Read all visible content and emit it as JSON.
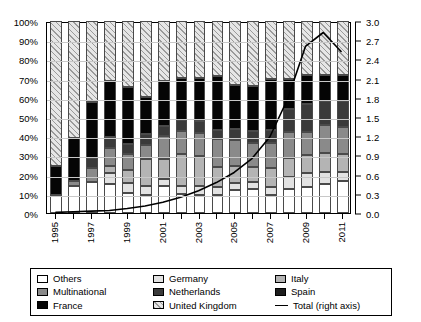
{
  "chart_data": {
    "type": "bar",
    "subtype": "stacked-100-percent-with-line-overlay",
    "title": "",
    "xlabel": "",
    "ylabel": "",
    "y2label": "",
    "grid": true,
    "legend_position": "bottom",
    "x": [
      1995,
      1996,
      1997,
      1998,
      1999,
      2000,
      2001,
      2002,
      2003,
      2004,
      2005,
      2006,
      2007,
      2008,
      2009,
      2010,
      2011
    ],
    "x_tick_labels": [
      "1995",
      "",
      "1997",
      "",
      "1999",
      "",
      "2001",
      "",
      "2003",
      "",
      "2005",
      "",
      "2007",
      "",
      "2009",
      "",
      "2011"
    ],
    "ylim": [
      0,
      100
    ],
    "y_tick_labels": [
      "0%",
      "10%",
      "20%",
      "30%",
      "40%",
      "50%",
      "60%",
      "70%",
      "80%",
      "90%",
      "100%"
    ],
    "y_ticks": [
      0,
      10,
      20,
      30,
      40,
      50,
      60,
      70,
      80,
      90,
      100
    ],
    "y2lim": [
      0,
      3.0
    ],
    "y2_tick_labels": [
      "0.0",
      "0.3",
      "0.6",
      "0.9",
      "1.2",
      "1.5",
      "1.8",
      "2.1",
      "2.4",
      "2.7",
      "3.0"
    ],
    "y2_ticks": [
      0,
      0.3,
      0.6,
      0.9,
      1.2,
      1.5,
      1.8,
      2.1,
      2.4,
      2.7,
      3.0
    ],
    "series": [
      {
        "name": "Others",
        "key": "others",
        "values": [
          9.2,
          14.2,
          16.0,
          15.0,
          10.3,
          9.2,
          14.3,
          9.8,
          9.3,
          9.2,
          12.2,
          12.4,
          9.3,
          12.6,
          13.8,
          15.1,
          16.5
        ]
      },
      {
        "name": "Germany",
        "key": "germany",
        "values": [
          0.0,
          0.0,
          0.0,
          6.0,
          5.3,
          5.0,
          3.6,
          4.3,
          4.8,
          4.6,
          3.6,
          3.5,
          4.0,
          6.3,
          6.8,
          6.1,
          4.7
        ]
      },
      {
        "name": "Italy",
        "key": "italy",
        "values": [
          0.0,
          0.0,
          0.0,
          3.4,
          6.9,
          13.7,
          10.0,
          16.4,
          15.6,
          10.2,
          8.8,
          8.3,
          10.0,
          10.0,
          9.8,
          10.3,
          9.6
        ]
      },
      {
        "name": "Multinational",
        "key": "multinational",
        "values": [
          0.0,
          2.5,
          7.2,
          9.5,
          8.1,
          7.4,
          12.0,
          12.0,
          11.9,
          14.7,
          13.6,
          12.5,
          13.2,
          13.1,
          11.9,
          14.4,
          14.2
        ]
      },
      {
        "name": "Netherlands",
        "key": "netherlands",
        "values": [
          0.0,
          0.0,
          5.3,
          5.9,
          5.5,
          6.1,
          5.2,
          6.1,
          6.4,
          4.6,
          5.7,
          5.8,
          6.5,
          12.2,
          14.5,
          12.7,
          13.2
        ]
      },
      {
        "name": "Spain",
        "key": "spain",
        "values": [
          0.0,
          0.0,
          0.0,
          0.0,
          0.0,
          0.0,
          0.0,
          0.0,
          0.0,
          0.0,
          0.0,
          0.0,
          0.0,
          0.0,
          0.0,
          0.0,
          0.0
        ]
      },
      {
        "name": "France",
        "key": "france",
        "values": [
          15.4,
          22.4,
          29.4,
          28.9,
          29.5,
          19.0,
          23.5,
          21.9,
          22.4,
          28.3,
          22.8,
          23.7,
          26.7,
          15.6,
          15.0,
          13.2,
          13.5
        ]
      },
      {
        "name": "United Kingdom",
        "key": "uk",
        "values": [
          75.4,
          60.9,
          42.1,
          31.3,
          34.4,
          39.6,
          31.4,
          29.5,
          29.6,
          28.4,
          33.3,
          33.8,
          30.3,
          30.2,
          28.2,
          28.2,
          28.3
        ]
      }
    ],
    "line_series": {
      "name": "Total (right axis)",
      "axis": "right",
      "values": [
        0.01,
        0.02,
        0.03,
        0.04,
        0.07,
        0.11,
        0.17,
        0.25,
        0.35,
        0.48,
        0.64,
        0.86,
        1.2,
        1.8,
        2.63,
        2.85,
        2.55
      ]
    }
  },
  "axes": {
    "left": {
      "ticks": [
        "0%",
        "10%",
        "20%",
        "30%",
        "40%",
        "50%",
        "60%",
        "70%",
        "80%",
        "90%",
        "100%"
      ]
    },
    "right": {
      "ticks": [
        "0.0",
        "0.3",
        "0.6",
        "0.9",
        "1.2",
        "1.5",
        "1.8",
        "2.1",
        "2.4",
        "2.7",
        "3.0"
      ]
    },
    "bottom": {
      "ticks": [
        "1995",
        "1997",
        "1999",
        "2001",
        "2003",
        "2005",
        "2007",
        "2009",
        "2011"
      ]
    }
  },
  "legend": {
    "items": [
      {
        "label": "Others",
        "swatch": "others-swatch"
      },
      {
        "label": "Germany",
        "swatch": "germany-swatch"
      },
      {
        "label": "Italy",
        "swatch": "italy-swatch"
      },
      {
        "label": "Multinational",
        "swatch": "multinational-swatch"
      },
      {
        "label": "Netherlands",
        "swatch": "netherlands-swatch"
      },
      {
        "label": "Spain",
        "swatch": "spain-swatch"
      },
      {
        "label": "France",
        "swatch": "france-swatch"
      },
      {
        "label": "United Kingdom",
        "swatch": "uk-swatch"
      },
      {
        "label": "Total (right axis)",
        "swatch": "line-swatch"
      }
    ]
  },
  "colors": {
    "others": "#ffffff",
    "germany": "#e2e2e2",
    "italy": "#b4b4b4",
    "multinational": "#8a8a8a",
    "netherlands": "#3a3a3a",
    "spain": "#1d1d1d",
    "france": "#050505",
    "uk": "#e6e6e6",
    "line": "#000000",
    "axis": "#000000",
    "grid": "#c8c8c8"
  }
}
